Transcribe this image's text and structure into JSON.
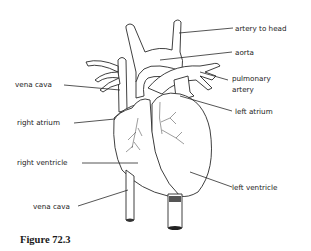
{
  "figure": {
    "caption": "Figure 72.3",
    "labels": {
      "artery_to_head": "artery to head",
      "aorta": "aorta",
      "pulmonary_artery_line1": "pulmonary",
      "pulmonary_artery_line2": "artery",
      "vena_cava_upper": "vena cava",
      "left_atrium": "left atrium",
      "right_atrium": "right atrium",
      "right_ventricle": "right ventricle",
      "left_ventricle": "left ventricle",
      "vena_cava_lower": "vena cava"
    }
  }
}
